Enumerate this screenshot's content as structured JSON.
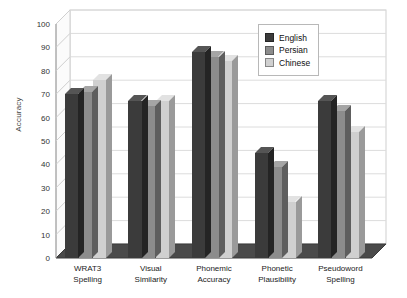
{
  "chart_data": {
    "type": "bar",
    "title": "",
    "xlabel": "",
    "ylabel": "Accuracy",
    "ylim": [
      0,
      100
    ],
    "yticks": [
      0,
      10,
      20,
      30,
      40,
      50,
      60,
      70,
      80,
      90,
      100
    ],
    "grid": true,
    "legend_position": "top-right",
    "style": "3d-clustered-column",
    "categories": [
      "WRAT3\nSpelling",
      "Visual\nSimilarity",
      "Phonemic\nAccuracy",
      "Phonetic\nPlausibility",
      "Pseudoword\nSpelling"
    ],
    "category_lines": [
      [
        "WRAT3",
        "Spelling"
      ],
      [
        "Visual",
        "Similarity"
      ],
      [
        "Phonemic",
        "Accuracy"
      ],
      [
        "Phonetic",
        "Plausibility"
      ],
      [
        "Pseudoword",
        "Spelling"
      ]
    ],
    "series": [
      {
        "name": "English",
        "color": "#3b3b3b",
        "values": [
          70,
          67,
          88,
          45,
          67
        ]
      },
      {
        "name": "Persian",
        "color": "#8c8c8c",
        "values": [
          71,
          65,
          86,
          39,
          63
        ]
      },
      {
        "name": "Chinese",
        "color": "#d0d0d0",
        "values": [
          76,
          67,
          84,
          24,
          54
        ]
      }
    ]
  },
  "legend": {
    "items": [
      {
        "label": "English",
        "color": "#3b3b3b"
      },
      {
        "label": "Persian",
        "color": "#8c8c8c"
      },
      {
        "label": "Chinese",
        "color": "#d0d0d0"
      }
    ]
  },
  "axis": {
    "y_title": "Accuracy"
  }
}
